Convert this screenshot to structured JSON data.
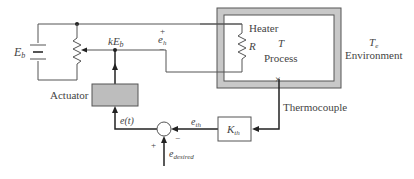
{
  "labels": {
    "battery": "E",
    "battery_sub": "b",
    "wiper": "kE",
    "wiper_sub": "b",
    "eh_plus": "+",
    "eh": "e",
    "eh_sub": "h",
    "eh_minus": "−",
    "heater": "Heater",
    "resistor": "R",
    "process_temp": "T",
    "process": "Process",
    "env_temp": "T",
    "env_temp_sub": "e",
    "environment": "Environment",
    "actuator": "Actuator",
    "error": "e(t)",
    "eth": "e",
    "eth_sub": "th",
    "kth": "K",
    "kth_sub": "th",
    "thermocouple": "Thermocouple",
    "sum_plus": "+",
    "sum_minus": "−",
    "edesired": "e",
    "edesired_sub": "desired"
  },
  "colors": {
    "line": "#555555",
    "wall": "#c8c8c8",
    "actuator_fill": "#bdbdbd",
    "text": "#444444"
  }
}
